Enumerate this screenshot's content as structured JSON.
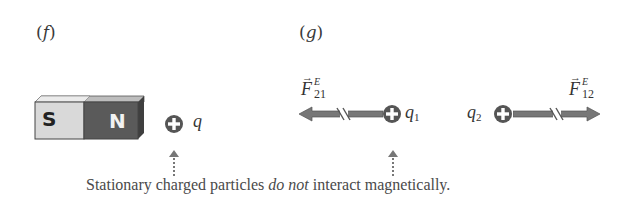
{
  "panels": {
    "f": {
      "label_open": "(",
      "label_letter": "f",
      "label_close": ")",
      "magnet": {
        "south_label": "S",
        "north_label": "N"
      },
      "charge": {
        "sign": "+",
        "label": "q"
      }
    },
    "g": {
      "label_open": "(",
      "label_letter": "g",
      "label_close": ")",
      "charge1": {
        "sign": "+",
        "label": "q",
        "subscript": "1"
      },
      "charge2": {
        "sign": "+",
        "label": "q",
        "subscript": "2"
      },
      "force_left": {
        "symbol": "F",
        "superscript": "E",
        "subscript": "21"
      },
      "force_right": {
        "symbol": "F",
        "superscript": "E",
        "subscript": "12"
      }
    }
  },
  "caption": {
    "before": "Stationary charged particles ",
    "emphasis": "do not",
    "after": " interact magnetically."
  },
  "colors": {
    "south_face": "#d9d9d9",
    "north_face": "#5a5a5a",
    "charge_fill": "#555555",
    "arrow_fill": "#777777",
    "text": "#3a3a3a"
  }
}
